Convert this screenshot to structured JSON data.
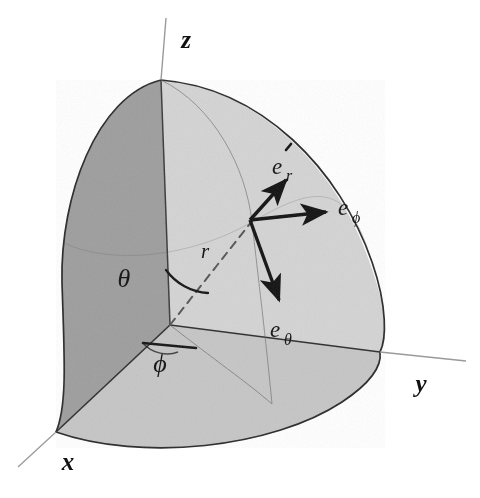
{
  "figure": {
    "background_color": "#ffffff",
    "ink_color": "#111111"
  },
  "axes": [
    {
      "id": "z",
      "label": "z",
      "x": 186,
      "y": 48,
      "direction": "up"
    },
    {
      "id": "y",
      "label": "y",
      "x": 421,
      "y": 392,
      "direction": "right-down"
    },
    {
      "id": "x",
      "label": "x",
      "x": 68,
      "y": 470,
      "direction": "left-down"
    }
  ],
  "angles": [
    {
      "id": "theta",
      "label": "θ",
      "x": 124,
      "y": 287,
      "between": "z-axis and radius"
    },
    {
      "id": "phi",
      "label": "ϕ",
      "x": 160,
      "y": 367,
      "between": "x-axis and projection"
    }
  ],
  "radius": {
    "id": "r",
    "label": "r",
    "x": 205,
    "y": 258,
    "style": "dashed",
    "from": [
      170,
      325
    ],
    "to": [
      250,
      220
    ]
  },
  "unit_vectors": [
    {
      "id": "e_r",
      "base": "e",
      "subscript": "r",
      "label": "e_r",
      "has_hat": true,
      "label_x": 281,
      "label_y": 172,
      "origin": [
        250,
        220
      ],
      "tip": [
        288,
        178
      ],
      "direction": "up-right, radially outward"
    },
    {
      "id": "e_phi",
      "base": "e",
      "subscript": "ϕ",
      "label": "e_ϕ",
      "has_hat": false,
      "label_x": 344,
      "label_y": 216,
      "origin": [
        250,
        220
      ],
      "tip": [
        330,
        211
      ],
      "direction": "right, azimuthal"
    },
    {
      "id": "e_theta",
      "base": "e",
      "subscript": "θ",
      "label": "e_θ",
      "label_x": 275,
      "label_y": 337,
      "has_hat": false,
      "origin": [
        250,
        220
      ],
      "tip": [
        281,
        304
      ],
      "direction": "down-right, polar"
    }
  ],
  "surfaces": [
    {
      "id": "xz-plane-face",
      "name": "x-z plane quarter disk",
      "fill": "#9e9e9e",
      "shade": "dark"
    },
    {
      "id": "xy-plane-face",
      "name": "x-y plane quarter disk",
      "fill": "#c2c2c2",
      "shade": "medium"
    },
    {
      "id": "sphere-octant-surface",
      "name": "spherical octant surface",
      "fill": "#d2d2d2",
      "shade": "light"
    }
  ],
  "geometry": {
    "origin": [
      170,
      325
    ],
    "north_pole": [
      161,
      80
    ],
    "x_axis_tip": [
      52,
      448
    ],
    "y_axis_tip": [
      412,
      357
    ],
    "sphere_left_bulge_x": 58
  }
}
